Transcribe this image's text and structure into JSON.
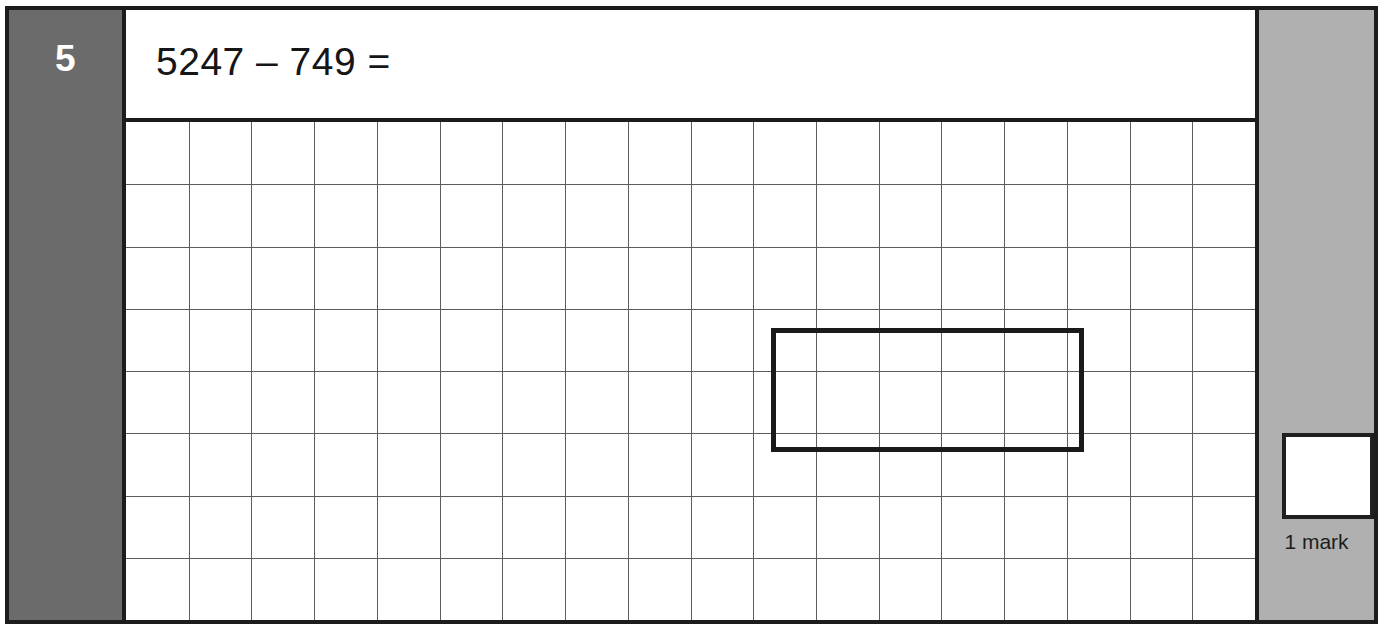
{
  "page": {
    "background_color": "#ffffff",
    "frame_border_color": "#1c1c1c"
  },
  "question": {
    "number": "5",
    "number_strip_color": "#6b6b6b",
    "number_text_color": "#ffffff",
    "text": "5247 – 749 =",
    "operands": [
      5247,
      749
    ],
    "operator": "–",
    "answer_value": ""
  },
  "working_grid": {
    "columns": 18,
    "rows": 8,
    "cell_width": 62.5,
    "cell_height": 62.25,
    "line_color": "#5d5d5d"
  },
  "answer_box": {
    "border_color": "#1a1a1a",
    "border_width": 5,
    "value": "",
    "span_columns": 5,
    "span_rows": 2
  },
  "mark_strip": {
    "background_color": "#b0b0b0",
    "mark_box_value": "",
    "mark_label": "1 mark",
    "marks_available": 1
  }
}
